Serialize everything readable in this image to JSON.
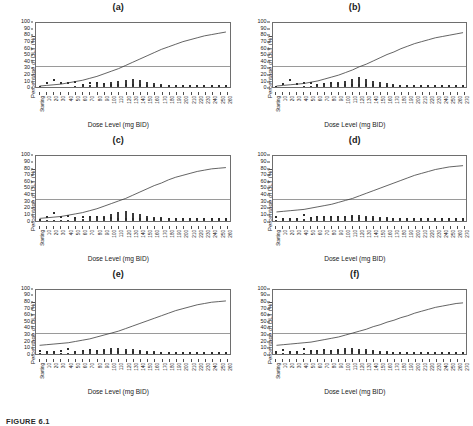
{
  "figure": {
    "caption": "FIGURE 6.1",
    "axis": {
      "ylabel": "Percentage of DLT (%)",
      "xlabel": "Dose Level (mg BID)",
      "yticks": [
        0,
        10,
        20,
        30,
        40,
        50,
        60,
        70,
        80,
        90,
        100
      ],
      "ylim": [
        0,
        100
      ],
      "first_xtick_label": "Starting",
      "reference_line_value": 33,
      "reference_line_color": "#9a9a9a",
      "curve_color": "#3c3c3c",
      "bar_color": "#3a3a3a",
      "grid": false,
      "legend": "none"
    }
  },
  "chart_data": [
    {
      "type": "line",
      "panel": "(a)",
      "title": "(a)",
      "xlabel": "Dose Level (mg BID)",
      "ylabel": "Percentage of DLT (%)",
      "ylim": [
        0,
        100
      ],
      "categories": [
        "Starting",
        "10",
        "20",
        "30",
        "40",
        "50",
        "60",
        "70",
        "80",
        "90",
        "100",
        "110",
        "120",
        "130",
        "140",
        "150",
        "160",
        "170",
        "180",
        "190",
        "200",
        "210",
        "220",
        "230",
        "240",
        "250",
        "260"
      ],
      "reference_line": 33,
      "series": [
        {
          "name": "Dose-toxicity curve",
          "type": "line",
          "values": [
            2,
            3,
            4,
            5,
            7,
            9,
            11,
            14,
            17,
            21,
            25,
            29,
            34,
            39,
            44,
            49,
            54,
            59,
            63,
            67,
            71,
            74,
            77,
            80,
            82,
            84,
            86
          ]
        },
        {
          "name": "MTD selection frequency",
          "type": "bar",
          "values": [
            0.5,
            0.5,
            1,
            1,
            1,
            1.5,
            2,
            3,
            4.5,
            6,
            8,
            10,
            12,
            12.5,
            11,
            9,
            7,
            5.5,
            4,
            3,
            2.5,
            2,
            2,
            1.5,
            1.5,
            1,
            1
          ]
        },
        {
          "name": "Observed DLT points",
          "type": "scatter",
          "values": [
            1,
            6,
            11,
            6,
            7,
            8,
            3,
            6,
            7,
            5,
            4,
            3,
            3,
            3,
            3,
            2,
            2,
            2,
            2,
            2,
            2,
            2,
            2,
            2,
            2,
            2,
            2
          ]
        }
      ]
    },
    {
      "type": "line",
      "panel": "(b)",
      "title": "(b)",
      "xlabel": "Dose Level (mg BID)",
      "ylabel": "Percentage of DLT (%)",
      "ylim": [
        0,
        100
      ],
      "categories": [
        "Starting",
        "10",
        "20",
        "30",
        "40",
        "50",
        "60",
        "70",
        "80",
        "90",
        "100",
        "110",
        "120",
        "130",
        "140",
        "150",
        "160",
        "170",
        "180",
        "190",
        "200",
        "210",
        "220",
        "230",
        "240",
        "250",
        "260",
        "270"
      ],
      "reference_line": 33,
      "series": [
        {
          "name": "Dose-toxicity curve",
          "type": "line",
          "values": [
            2,
            3,
            4,
            5,
            6,
            8,
            10,
            13,
            16,
            19,
            23,
            27,
            32,
            36,
            41,
            46,
            51,
            55,
            60,
            64,
            68,
            71,
            74,
            77,
            79,
            81,
            83,
            85
          ]
        },
        {
          "name": "MTD selection frequency",
          "type": "bar",
          "values": [
            0.5,
            0.5,
            1,
            1,
            1.5,
            2,
            3,
            4,
            6,
            8,
            10,
            13,
            16,
            13,
            10,
            8,
            6,
            5,
            4,
            3,
            2.5,
            2,
            2,
            1.5,
            1.5,
            1,
            1,
            1
          ]
        },
        {
          "name": "Observed DLT points",
          "type": "scatter",
          "values": [
            1,
            5,
            11,
            5,
            6,
            7,
            3,
            5,
            6,
            5,
            4,
            3,
            3,
            3,
            3,
            2,
            2,
            2,
            2,
            2,
            2,
            2,
            2,
            2,
            2,
            2,
            2,
            2
          ]
        }
      ]
    },
    {
      "type": "line",
      "panel": "(c)",
      "title": "(c)",
      "xlabel": "Dose Level (mg BID)",
      "ylabel": "Percentage of DLT (%)",
      "ylim": [
        0,
        100
      ],
      "categories": [
        "Starting",
        "10",
        "20",
        "30",
        "40",
        "50",
        "60",
        "70",
        "80",
        "90",
        "100",
        "110",
        "120",
        "130",
        "140",
        "150",
        "160",
        "170",
        "180",
        "190",
        "200",
        "210",
        "220",
        "230",
        "240",
        "250",
        "260"
      ],
      "reference_line": 33,
      "series": [
        {
          "name": "Dose-toxicity curve",
          "type": "line",
          "values": [
            3,
            4,
            5,
            6,
            8,
            10,
            12,
            15,
            18,
            22,
            26,
            30,
            34,
            39,
            44,
            49,
            54,
            58,
            63,
            67,
            70,
            73,
            76,
            78,
            80,
            81,
            82
          ]
        },
        {
          "name": "MTD selection frequency",
          "type": "bar",
          "values": [
            0.5,
            0.5,
            1,
            1,
            1.5,
            2,
            3,
            4,
            6,
            8,
            10,
            13,
            15,
            12,
            10,
            8,
            6,
            5,
            4,
            3,
            2.5,
            2,
            2,
            1.5,
            1.5,
            1,
            1
          ]
        },
        {
          "name": "Observed DLT points",
          "type": "scatter",
          "values": [
            1,
            6,
            12,
            6,
            8,
            4,
            5,
            6,
            5,
            4,
            4,
            3,
            3,
            3,
            2,
            2,
            2,
            2,
            2,
            2,
            2,
            2,
            2,
            2,
            2,
            2,
            2
          ]
        }
      ]
    },
    {
      "type": "line",
      "panel": "(d)",
      "title": "(d)",
      "xlabel": "Dose Level (mg BID)",
      "ylabel": "Percentage of DLT (%)",
      "ylim": [
        0,
        100
      ],
      "categories": [
        "Starting",
        "10",
        "20",
        "30",
        "40",
        "50",
        "60",
        "70",
        "80",
        "90",
        "100",
        "110",
        "120",
        "130",
        "140",
        "150",
        "160",
        "170",
        "180",
        "190",
        "200",
        "210",
        "220",
        "230",
        "240",
        "250",
        "260",
        "270"
      ],
      "reference_line": 33,
      "series": [
        {
          "name": "Dose-toxicity curve",
          "type": "line",
          "values": [
            13,
            14,
            15,
            16,
            17,
            19,
            21,
            23,
            25,
            28,
            31,
            34,
            38,
            42,
            46,
            50,
            54,
            58,
            62,
            66,
            70,
            73,
            76,
            79,
            81,
            83,
            84,
            85
          ]
        },
        {
          "name": "MTD selection frequency",
          "type": "bar",
          "values": [
            1,
            1,
            1.5,
            2,
            2,
            3,
            4,
            5,
            6,
            7,
            8,
            9,
            9,
            8,
            7,
            6,
            5,
            4,
            3,
            3,
            2.5,
            2,
            2,
            1.5,
            1.5,
            1,
            1,
            1
          ]
        },
        {
          "name": "Observed DLT points",
          "type": "scatter",
          "values": [
            5,
            3,
            3,
            3,
            9,
            4,
            5,
            5,
            5,
            5,
            5,
            5,
            4,
            4,
            3,
            3,
            3,
            2,
            2,
            2,
            2,
            2,
            2,
            2,
            2,
            2,
            2,
            2
          ]
        }
      ]
    },
    {
      "type": "line",
      "panel": "(e)",
      "title": "(e)",
      "xlabel": "Dose Level (mg BID)",
      "ylabel": "Percentage of DLT (%)",
      "ylim": [
        0,
        100
      ],
      "categories": [
        "Starting",
        "10",
        "20",
        "30",
        "40",
        "50",
        "60",
        "70",
        "80",
        "90",
        "100",
        "110",
        "120",
        "130",
        "140",
        "150",
        "160",
        "170",
        "180",
        "190",
        "200",
        "210",
        "220",
        "230",
        "240",
        "250",
        "260"
      ],
      "reference_line": 33,
      "series": [
        {
          "name": "Dose-toxicity curve",
          "type": "line",
          "values": [
            14,
            15,
            16,
            17,
            18,
            20,
            22,
            24,
            27,
            30,
            33,
            36,
            40,
            44,
            48,
            52,
            56,
            60,
            64,
            68,
            71,
            74,
            77,
            79,
            81,
            82,
            83
          ]
        },
        {
          "name": "MTD selection frequency",
          "type": "bar",
          "values": [
            1,
            1,
            1.5,
            2,
            2,
            3,
            4,
            5,
            6,
            8,
            10,
            9,
            8,
            7,
            6,
            5,
            4,
            3.5,
            3,
            2.5,
            2,
            2,
            1.5,
            1.5,
            1,
            1,
            1
          ]
        },
        {
          "name": "Observed DLT points",
          "type": "scatter",
          "values": [
            4,
            3,
            3,
            4,
            8,
            3,
            4,
            6,
            4,
            4,
            4,
            3,
            3,
            3,
            3,
            2,
            2,
            2,
            2,
            2,
            2,
            2,
            2,
            2,
            2,
            2,
            2
          ]
        }
      ]
    },
    {
      "type": "line",
      "panel": "(f)",
      "title": "(f)",
      "xlabel": "Dose Level (mg BID)",
      "ylabel": "Percentage of DLT (%)",
      "ylim": [
        0,
        100
      ],
      "categories": [
        "Starting",
        "10",
        "20",
        "30",
        "40",
        "50",
        "60",
        "70",
        "80",
        "90",
        "100",
        "110",
        "120",
        "130",
        "140",
        "150",
        "160",
        "170",
        "180",
        "190",
        "200",
        "210",
        "220",
        "230",
        "240",
        "250",
        "260",
        "270"
      ],
      "reference_line": 33,
      "series": [
        {
          "name": "Dose-toxicity curve",
          "type": "line",
          "values": [
            14,
            15,
            16,
            17,
            18,
            19,
            21,
            23,
            25,
            27,
            30,
            33,
            36,
            39,
            43,
            46,
            50,
            53,
            57,
            60,
            64,
            67,
            70,
            73,
            75,
            77,
            79,
            80
          ]
        },
        {
          "name": "MTD selection frequency",
          "type": "bar",
          "values": [
            1,
            1,
            1.5,
            2,
            2,
            3,
            4,
            5,
            6,
            7,
            9,
            10,
            8,
            7,
            6,
            5,
            4,
            3.5,
            3,
            2.5,
            2,
            2,
            1.5,
            1.5,
            1,
            1,
            1,
            1
          ]
        },
        {
          "name": "Observed DLT points",
          "type": "scatter",
          "values": [
            3,
            6,
            3,
            3,
            8,
            4,
            5,
            6,
            5,
            4,
            5,
            4,
            3,
            3,
            3,
            2,
            2,
            2,
            2,
            2,
            2,
            2,
            2,
            2,
            2,
            2,
            2,
            2
          ]
        }
      ]
    }
  ]
}
